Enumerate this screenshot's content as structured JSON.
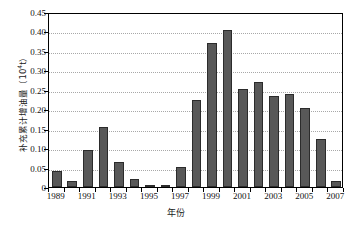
{
  "chart_data": {
    "type": "bar",
    "title": "",
    "xlabel": "年份",
    "ylabel": "补充累计增油量（10⁴t）",
    "ylabel_main": "补充累计增油量（10",
    "ylabel_exp": "4",
    "ylabel_tail": "t）",
    "categories": [
      1989,
      1990,
      1991,
      1992,
      1993,
      1994,
      1995,
      1996,
      1997,
      1998,
      1999,
      2000,
      2001,
      2002,
      2003,
      2004,
      2005,
      2006,
      2007
    ],
    "values": [
      0.04,
      0.015,
      0.095,
      0.155,
      0.065,
      0.021,
      0.001,
      0.003,
      0.052,
      0.223,
      0.371,
      0.405,
      0.252,
      0.27,
      0.234,
      0.24,
      0.202,
      0.124,
      0.016
    ],
    "ylim": [
      0,
      0.45
    ],
    "yticks": [
      0,
      0.05,
      0.1,
      0.15,
      0.2,
      0.25,
      0.3,
      0.35,
      0.4,
      0.45
    ],
    "ytick_labels": [
      "0",
      "0.05",
      "0.10",
      "0.15",
      "0.20",
      "0.25",
      "0.30",
      "0.35",
      "0.40",
      "0.45"
    ],
    "xtick_labels": [
      "1989",
      "1991",
      "1993",
      "1995",
      "1997",
      "1999",
      "2001",
      "2003",
      "2005",
      "2007"
    ],
    "xticks": [
      1989,
      1991,
      1993,
      1995,
      1997,
      1999,
      2001,
      2003,
      2005,
      2007
    ],
    "grid": true,
    "grid_style": "dotted",
    "legend": null,
    "bar_color": "#585858",
    "bar_edge_color": "#2b2b2b",
    "grid_color": "#a8a8a8",
    "axis_color": "#000000",
    "background": "#ffffff"
  }
}
